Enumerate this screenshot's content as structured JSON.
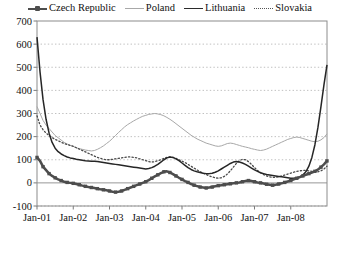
{
  "chart_data": {
    "type": "line",
    "title": "",
    "subtitle": "",
    "xlabel": "",
    "ylabel": "",
    "ylim": [
      -100,
      700
    ],
    "yticks": [
      -100,
      0,
      100,
      200,
      300,
      400,
      500,
      600,
      700
    ],
    "ytick_labels": [
      "-100",
      "0",
      "100",
      "200",
      "300",
      "400",
      "500",
      "600",
      "700"
    ],
    "xtick_labels": [
      "Jan-01",
      "Jan-02",
      "Jan-03",
      "Jan-04",
      "Jan-05",
      "Jan-06",
      "Jan-07",
      "Jan-08"
    ],
    "x_start": "Jan-01",
    "x_end": "Jan-08",
    "x_frequency": "monthly",
    "grid": "horizontal dotted gridlines",
    "legend_position": "top-center",
    "legend": [
      "Czech Republic",
      "Poland",
      "Lithuania",
      "Slovakia"
    ],
    "series": [
      {
        "name": "Czech Republic",
        "style": "thick line with square markers",
        "color": "#4d4d4d",
        "values": [
          110,
          95,
          70,
          55,
          40,
          30,
          22,
          15,
          10,
          5,
          2,
          0,
          -2,
          -5,
          -8,
          -12,
          -15,
          -18,
          -20,
          -22,
          -25,
          -28,
          -30,
          -32,
          -35,
          -38,
          -40,
          -38,
          -35,
          -30,
          -25,
          -20,
          -15,
          -10,
          -5,
          0,
          5,
          12,
          20,
          28,
          35,
          42,
          48,
          50,
          45,
          38,
          30,
          22,
          15,
          8,
          2,
          -5,
          -10,
          -14,
          -18,
          -20,
          -22,
          -20,
          -18,
          -15,
          -12,
          -10,
          -8,
          -6,
          -4,
          -2,
          0,
          2,
          5,
          8,
          10,
          8,
          5,
          2,
          0,
          -3,
          -6,
          -8,
          -10,
          -8,
          -5,
          -2,
          2,
          6,
          10,
          15,
          20,
          25,
          30,
          35,
          40,
          45,
          50,
          58,
          68,
          80,
          95
        ]
      },
      {
        "name": "Poland",
        "style": "thin light line",
        "color": "#a8a8a8",
        "values": [
          330,
          300,
          270,
          250,
          235,
          220,
          205,
          195,
          185,
          175,
          168,
          162,
          158,
          152,
          148,
          145,
          142,
          140,
          138,
          140,
          145,
          152,
          160,
          170,
          180,
          192,
          205,
          218,
          230,
          242,
          252,
          260,
          268,
          275,
          282,
          288,
          292,
          296,
          298,
          300,
          298,
          295,
          290,
          283,
          275,
          266,
          256,
          246,
          236,
          226,
          216,
          206,
          198,
          190,
          184,
          178,
          172,
          168,
          164,
          160,
          158,
          160,
          165,
          170,
          172,
          170,
          166,
          162,
          158,
          155,
          152,
          148,
          145,
          142,
          140,
          142,
          146,
          152,
          158,
          164,
          170,
          176,
          182,
          188,
          192,
          196,
          198,
          196,
          192,
          188,
          184,
          180,
          178,
          180,
          186,
          196,
          212
        ]
      },
      {
        "name": "Lithuania",
        "style": "medium dark line",
        "color": "#262626",
        "values": [
          630,
          480,
          360,
          275,
          215,
          175,
          150,
          135,
          125,
          118,
          112,
          108,
          105,
          102,
          100,
          98,
          96,
          95,
          94,
          93,
          92,
          90,
          88,
          86,
          84,
          82,
          80,
          78,
          76,
          74,
          72,
          70,
          68,
          66,
          64,
          62,
          60,
          62,
          66,
          72,
          80,
          90,
          100,
          108,
          112,
          110,
          104,
          96,
          86,
          76,
          66,
          58,
          52,
          48,
          45,
          42,
          40,
          40,
          42,
          46,
          52,
          60,
          68,
          76,
          84,
          90,
          92,
          90,
          86,
          80,
          72,
          64,
          56,
          50,
          44,
          40,
          36,
          34,
          32,
          30,
          28,
          26,
          24,
          22,
          20,
          20,
          22,
          26,
          34,
          48,
          72,
          110,
          165,
          240,
          330,
          425,
          510
        ]
      },
      {
        "name": "Slovakia",
        "style": "dotted line",
        "color": "#4a4a4a",
        "values": [
          290,
          250,
          230,
          215,
          205,
          196,
          188,
          182,
          176,
          170,
          166,
          162,
          158,
          152,
          146,
          140,
          134,
          128,
          122,
          116,
          110,
          106,
          102,
          100,
          100,
          102,
          104,
          106,
          108,
          110,
          112,
          112,
          110,
          108,
          104,
          100,
          96,
          92,
          90,
          92,
          96,
          100,
          106,
          110,
          112,
          110,
          106,
          100,
          94,
          88,
          80,
          72,
          64,
          56,
          48,
          42,
          36,
          30,
          26,
          22,
          20,
          22,
          28,
          38,
          52,
          68,
          84,
          96,
          102,
          100,
          92,
          80,
          66,
          54,
          44,
          36,
          30,
          26,
          24,
          24,
          26,
          30,
          34,
          38,
          42,
          46,
          50,
          52,
          54,
          54,
          52,
          50,
          48,
          48,
          52,
          60,
          72
        ]
      }
    ]
  }
}
